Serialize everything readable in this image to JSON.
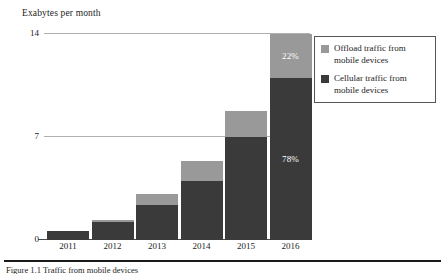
{
  "figure": {
    "axis_title": "Exabytes per month",
    "caption": "Figure 1.1  Traffic from mobile devices"
  },
  "legend": {
    "position": "top-right",
    "items": [
      {
        "label": "Offload traffic from mobile devices",
        "color": "#999999",
        "swatch_name": "offload-swatch"
      },
      {
        "label": "Cellular traffic from mobile devices",
        "color": "#3a3a3a",
        "swatch_name": "cellular-swatch"
      }
    ]
  },
  "chart_data": {
    "type": "bar",
    "stacked": true,
    "title": "",
    "subtitle": "",
    "xlabel": "",
    "ylabel": "Exabytes per month",
    "ylim": [
      0,
      14
    ],
    "yticks": [
      0,
      7,
      14
    ],
    "ytick_labels": [
      "0",
      "7",
      "14"
    ],
    "grid": true,
    "grid_lines_at": [
      7,
      14
    ],
    "legend_position": "top-right",
    "categories": [
      "2011",
      "2012",
      "2013",
      "2014",
      "2015",
      "2016"
    ],
    "series": [
      {
        "name": "Cellular traffic from mobile devices",
        "color": "#3a3a3a",
        "values": [
          0.6,
          1.2,
          2.4,
          4.0,
          7.0,
          11.0
        ]
      },
      {
        "name": "Offload traffic from mobile devices",
        "color": "#999999",
        "values": [
          0.0,
          0.15,
          0.75,
          1.4,
          1.75,
          3.0
        ]
      }
    ],
    "totals": [
      0.6,
      1.35,
      3.15,
      5.4,
      8.75,
      14.0
    ],
    "annotations": [
      {
        "category": "2016",
        "series": "Offload traffic from mobile devices",
        "text": "22%"
      },
      {
        "category": "2016",
        "series": "Cellular traffic from mobile devices",
        "text": "78%"
      }
    ]
  },
  "colors": {
    "cellular": "#3a3a3a",
    "offload": "#999999",
    "gridline": "#b0b0b0",
    "axis": "#4a4a4a",
    "background": "#ffffff",
    "text": "#1c1c1c"
  }
}
